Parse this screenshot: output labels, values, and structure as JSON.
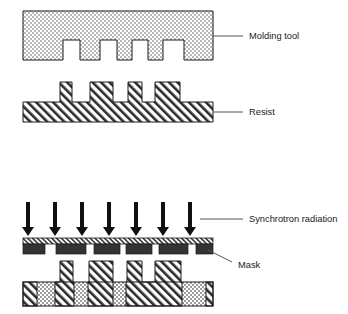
{
  "figure": {
    "background_color": "#ffffff",
    "outline_color": "#1a1a1a",
    "stipple_color": "#b9b9b9",
    "hatch_color": "#2b2b2b",
    "absorber_color": "#333333"
  },
  "labels": {
    "molding_tool": "Molding tool",
    "resist": "Resist",
    "synchrotron_radiation": "Synchrotron radiation",
    "mask": "Mask"
  },
  "stages": [
    {
      "id": "molding-tool",
      "label": "Molding tool",
      "fill": "stipple",
      "body": {
        "x": 23,
        "y": 11,
        "width": 190,
        "height": 49
      },
      "notches": [
        {
          "x": 63,
          "width": 17,
          "depth": 20
        },
        {
          "x": 100,
          "width": 17,
          "depth": 20
        },
        {
          "x": 132,
          "width": 16,
          "depth": 20
        },
        {
          "x": 163,
          "width": 21,
          "depth": 20
        }
      ],
      "leader": {
        "x1": 213,
        "y1": 36,
        "x2": 243,
        "y2": 36
      },
      "label_pos": {
        "x": 249,
        "y": 39
      }
    },
    {
      "id": "resist",
      "label": "Resist",
      "fill": "hatch",
      "base": {
        "x": 23,
        "y": 102,
        "width": 190,
        "height": 20
      },
      "posts": [
        {
          "x": 60,
          "width": 12,
          "height": 20
        },
        {
          "x": 90,
          "width": 23,
          "height": 20
        },
        {
          "x": 128,
          "width": 14,
          "height": 20
        },
        {
          "x": 155,
          "width": 25,
          "height": 20
        }
      ],
      "leader": {
        "x1": 213,
        "y1": 112,
        "x2": 243,
        "y2": 112
      },
      "label_pos": {
        "x": 249,
        "y": 115
      }
    },
    {
      "id": "exposure",
      "label": "Synchrotron radiation",
      "arrows": {
        "count": 7,
        "x_positions": [
          28,
          55,
          82,
          109,
          136,
          163,
          190
        ],
        "top_y": 202,
        "tip_y": 236,
        "shaft_width": 4,
        "head_width": 12,
        "head_height": 10
      },
      "leader": {
        "x1": 200,
        "y1": 219,
        "x2": 243,
        "y2": 219
      },
      "label_pos": {
        "x": 249,
        "y": 222
      }
    },
    {
      "id": "mask",
      "label": "Mask",
      "membrane": {
        "x": 23,
        "y": 238,
        "width": 190,
        "height": 6,
        "fill": "hatch-fine"
      },
      "absorbers": [
        {
          "x": 23,
          "width": 22
        },
        {
          "x": 56,
          "width": 30
        },
        {
          "x": 94,
          "width": 26
        },
        {
          "x": 126,
          "width": 26
        },
        {
          "x": 159,
          "width": 29
        },
        {
          "x": 196,
          "width": 17
        }
      ],
      "absorber_y": 244,
      "absorber_height": 10,
      "leader": {
        "x1": 208,
        "y1": 250,
        "x2": 232,
        "y2": 262
      },
      "label_pos": {
        "x": 238,
        "y": 268
      }
    },
    {
      "id": "exposed-resist",
      "base": {
        "x": 23,
        "y": 282,
        "width": 190,
        "height": 24
      },
      "posts": [
        {
          "x": 60,
          "width": 13,
          "height": 21
        },
        {
          "x": 89,
          "width": 24,
          "height": 21
        },
        {
          "x": 127,
          "width": 15,
          "height": 21
        },
        {
          "x": 155,
          "width": 26,
          "height": 21
        }
      ],
      "stipple_regions": [
        {
          "x": 37,
          "width": 18
        },
        {
          "x": 74,
          "width": 14
        },
        {
          "x": 113,
          "width": 13
        },
        {
          "x": 182,
          "width": 24
        }
      ]
    }
  ]
}
